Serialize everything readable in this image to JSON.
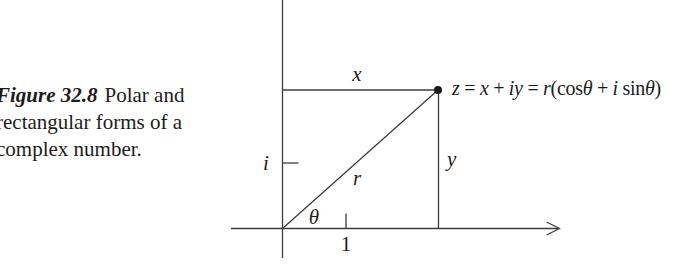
{
  "figure": {
    "caption": {
      "label": "Figure 32.8",
      "line1_rest": "Polar and",
      "line2": "rectangular forms of a",
      "line3": "complex number."
    },
    "equation": {
      "full": "z = x + iy = r(cosθ + i sinθ)",
      "parts": [
        {
          "text": "z"
        },
        {
          "text": " = "
        },
        {
          "text": "x"
        },
        {
          "text": " + "
        },
        {
          "text": "iy"
        },
        {
          "text": " = "
        },
        {
          "text": "r"
        },
        {
          "text": "(cos"
        },
        {
          "text": "θ"
        },
        {
          "text": " + "
        },
        {
          "text": "i"
        },
        {
          "text": " sin"
        },
        {
          "text": "θ"
        },
        {
          "text": ")"
        }
      ]
    },
    "diagram_labels": {
      "x_segment": "x",
      "y_segment": "y",
      "radius": "r",
      "angle": "θ",
      "imaginary_unit": "i",
      "real_unit": "1"
    },
    "colors": {
      "ink": "#1c1c1c",
      "line": "#3c3c3c",
      "background": "#ffffff"
    }
  }
}
